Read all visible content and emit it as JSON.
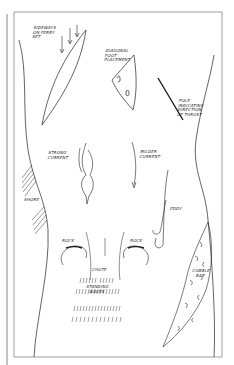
{
  "figure": {
    "type": "river-crossing-diagram",
    "colors": {
      "ink": "#222222",
      "paper": "#ffffff",
      "frame": "#888888"
    },
    "labels": {
      "sideways": "SIDEWAYS\nON FERRY\nSET",
      "diagonal": "DIAGONAL\nFOOT\nPLACEMENT",
      "pole": "POLE\nINDICATING\nDIRECTION\nOF THRUST",
      "strong_current": "STRONG\nCURRENT",
      "milder_current": "MILDER\nCURRENT",
      "eddy": "EDDY",
      "shore": "SHORE",
      "rock_left": "ROCK",
      "rock_right": "ROCK",
      "chute": "CHUTE",
      "standing_waves": "STANDING\nWAVES",
      "cobble_bar": "COBBLE\nBAR"
    },
    "icons": [
      "down-arrow-icon",
      "current-arrow-icon",
      "eddy-hook-icon",
      "pole-icon",
      "rock-icon"
    ]
  }
}
